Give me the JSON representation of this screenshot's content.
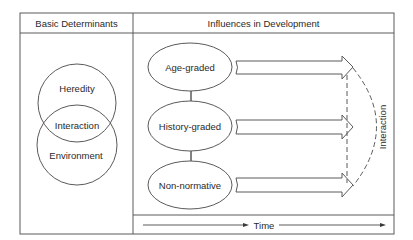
{
  "panels": {
    "left": {
      "header": "Basic Determinants",
      "venn": {
        "top": "Heredity",
        "overlap": "Interaction",
        "bottom": "Environment"
      }
    },
    "right": {
      "header": "Influences in Development",
      "influences": [
        {
          "label": "Age-graded"
        },
        {
          "label": "History-graded"
        },
        {
          "label": "Non-normative"
        }
      ],
      "interaction_label": "Interaction",
      "time_label": "Time"
    }
  },
  "colors": {
    "line": "#555555",
    "text": "#2a2a2a",
    "background": "#ffffff"
  }
}
